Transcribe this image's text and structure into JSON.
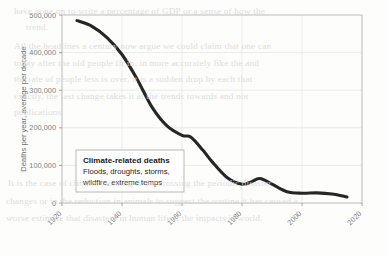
{
  "figure": {
    "background_color": "#fdfdfc",
    "line_color": "#262626",
    "grid_color": "#e6e6e4",
    "frame_color": "#b9b9b7",
    "tick_color": "#7d7d7d"
  },
  "annotation": {
    "title": "Climate-related deaths",
    "line1": "Floods, droughts, storms,",
    "line2": "wildfire, extreme temps"
  },
  "background_text": {
    "lines": [
      "have gone on to write a percentage of GDP or a sense of how the",
      "trend.",
      "All the headlines a century now argue we could claim that one can",
      "today after the old people fit in, in more accurately like the and",
      "the rate of people less is over, it is a sudden drop by each that",
      "exactly, the last change takes it at the trends towards and not",
      "publications.",
      "It is the case of climate building is the crossing the periodic disaster",
      "changes or in the reduction in animals to suggest the routine it has caused a",
      "worse estimate that disasters in human life if the impacts is world."
    ]
  },
  "chart_data": {
    "type": "line",
    "title": "",
    "subtitle": "",
    "xlabel": "",
    "ylabel": "Deaths per year, average per decade",
    "xlim": [
      1920,
      2020
    ],
    "ylim": [
      0,
      500000
    ],
    "xticks": [
      1920,
      1940,
      1960,
      1980,
      2000,
      2020
    ],
    "xticklabels": [
      "1920",
      "1940",
      "1960",
      "1980",
      "2000",
      "2020"
    ],
    "yticks": [
      0,
      100000,
      200000,
      300000,
      400000,
      500000
    ],
    "yticklabels": [
      "0",
      "100,000",
      "200,000",
      "300,000",
      "400,000",
      "500,000"
    ],
    "grid": true,
    "legend": "none",
    "series": [
      {
        "name": "Climate-related deaths",
        "color": "#262626",
        "x": [
          1925,
          1930,
          1935,
          1940,
          1945,
          1950,
          1955,
          1960,
          1963,
          1967,
          1970,
          1975,
          1980,
          1983,
          1986,
          1990,
          1995,
          2000,
          2005,
          2010,
          2015
        ],
        "values": [
          485000,
          470000,
          440000,
          395000,
          330000,
          255000,
          205000,
          180000,
          175000,
          140000,
          110000,
          68000,
          50000,
          56000,
          65000,
          50000,
          30000,
          26000,
          27000,
          24000,
          16000
        ]
      }
    ]
  }
}
